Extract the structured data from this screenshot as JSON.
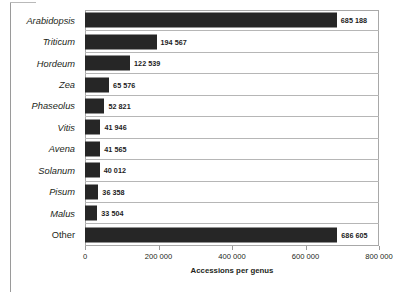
{
  "chart_data": {
    "type": "bar",
    "orientation": "horizontal",
    "title": "",
    "xlabel": "Accessions per genus",
    "ylabel": "",
    "xlim": [
      0,
      800000
    ],
    "grid": "horizontal-row-separators",
    "legend": "none",
    "bar_color": "#262626",
    "categories": [
      "Arabidopsis",
      "Triticum",
      "Hordeum",
      "Zea",
      "Phaseolus",
      "Vitis",
      "Avena",
      "Solanum",
      "Pisum",
      "Malus",
      "Other"
    ],
    "category_styles": [
      "italic",
      "italic",
      "italic",
      "italic",
      "italic",
      "italic",
      "italic",
      "italic",
      "italic",
      "italic",
      "normal"
    ],
    "values": [
      685188,
      194567,
      122539,
      65576,
      52821,
      41946,
      41565,
      40012,
      36358,
      33504,
      686605
    ],
    "value_labels": [
      "685 188",
      "194 567",
      "122 539",
      "65 576",
      "52 821",
      "41 946",
      "41 565",
      "40 012",
      "36 358",
      "33 504",
      "686 605"
    ],
    "xticks": [
      0,
      200000,
      400000,
      600000,
      800000
    ],
    "xtick_labels": [
      "0",
      "200 000",
      "400 000",
      "600 000",
      "800 000"
    ]
  }
}
